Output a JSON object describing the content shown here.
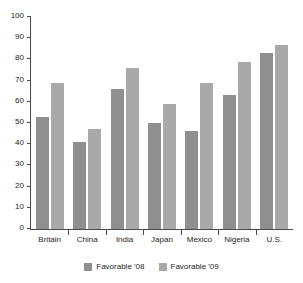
{
  "chart_data": {
    "type": "bar",
    "title": "",
    "subtitle": "",
    "xlabel": "",
    "ylabel": "",
    "ylim": [
      0,
      100
    ],
    "ytick_step": 10,
    "yticks": [
      0,
      10,
      20,
      30,
      40,
      50,
      60,
      70,
      80,
      90,
      100
    ],
    "ytick_labels": [
      "0",
      "10",
      "20",
      "30",
      "40",
      "50",
      "60",
      "70",
      "80",
      "90",
      "100"
    ],
    "grid": false,
    "legend_position": "bottom-center",
    "categories": [
      "Britain",
      "China",
      "India",
      "Japan",
      "Mexico",
      "Nigeria",
      "U.S."
    ],
    "series": [
      {
        "name": "Favorable '08",
        "color": "#8f8f8f",
        "values": [
          53,
          41,
          66,
          50,
          46,
          63,
          83
        ]
      },
      {
        "name": "Favorable '09",
        "color": "#a9a9a9",
        "values": [
          69,
          47,
          76,
          59,
          69,
          79,
          87
        ]
      }
    ]
  },
  "legend": {
    "entries": [
      {
        "label": "Favorable '08"
      },
      {
        "label": "Favorable '09"
      }
    ]
  },
  "colors": {
    "series_08": "#8f8f8f",
    "series_09": "#a9a9a9",
    "axis": "#4a4a4a",
    "text": "#1c1c1c",
    "background": "#ffffff"
  }
}
